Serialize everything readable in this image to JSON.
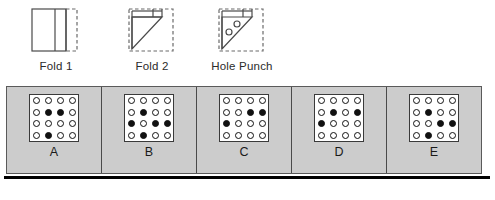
{
  "fold_sequence": {
    "steps": [
      {
        "id": "fold-1",
        "label": "Fold 1",
        "figure": "paper-square-folded-left-third"
      },
      {
        "id": "fold-2",
        "label": "Fold 2",
        "figure": "paper-triangle-diagonal-fold"
      },
      {
        "id": "hole-punch",
        "label": "Hole Punch",
        "figure": "paper-triangle-with-two-holes",
        "hole_count": 2
      }
    ]
  },
  "answer_panel": {
    "grid_rows": 4,
    "grid_cols": 4,
    "options": [
      {
        "letter": "A",
        "grid": [
          [
            "open",
            "open",
            "open",
            "open"
          ],
          [
            "open",
            "filled",
            "filled",
            "open"
          ],
          [
            "open",
            "open",
            "open",
            "open"
          ],
          [
            "open",
            "filled",
            "open",
            "open"
          ]
        ]
      },
      {
        "letter": "B",
        "grid": [
          [
            "open",
            "open",
            "open",
            "open"
          ],
          [
            "open",
            "filled",
            "open",
            "open"
          ],
          [
            "filled",
            "open",
            "filled",
            "filled"
          ],
          [
            "open",
            "filled",
            "open",
            "open"
          ]
        ]
      },
      {
        "letter": "C",
        "grid": [
          [
            "open",
            "open",
            "open",
            "open"
          ],
          [
            "open",
            "open",
            "filled",
            "filled"
          ],
          [
            "filled",
            "open",
            "open",
            "open"
          ],
          [
            "open",
            "open",
            "open",
            "open"
          ]
        ]
      },
      {
        "letter": "D",
        "grid": [
          [
            "open",
            "open",
            "open",
            "open"
          ],
          [
            "open",
            "filled",
            "open",
            "filled"
          ],
          [
            "filled",
            "open",
            "open",
            "open"
          ],
          [
            "open",
            "open",
            "open",
            "open"
          ]
        ]
      },
      {
        "letter": "E",
        "grid": [
          [
            "open",
            "open",
            "open",
            "open"
          ],
          [
            "open",
            "filled",
            "open",
            "open"
          ],
          [
            "open",
            "open",
            "filled",
            "filled"
          ],
          [
            "open",
            "filled",
            "open",
            "open"
          ]
        ]
      }
    ]
  },
  "colors": {
    "panel_background": "#cccccc",
    "grid_background": "#ffffff",
    "dot_stroke": "#111111",
    "dot_fill": "#111111",
    "line": "#4a4a4a",
    "baseline": "#000000"
  }
}
